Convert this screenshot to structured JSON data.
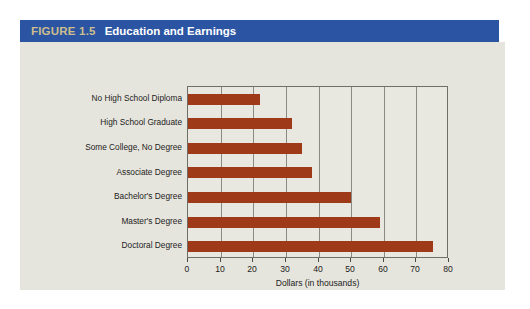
{
  "figure": {
    "number": "FIGURE 1.5",
    "title": "Education and Earnings",
    "header_color": "#2b55a2",
    "number_color": "#cdbe8e",
    "title_color": "#ffffff",
    "background_color": "#e6e5dd"
  },
  "chart_data": {
    "type": "bar",
    "orientation": "horizontal",
    "title": "Education and Earnings",
    "xlabel": "Dollars (in thousands)",
    "ylabel": "",
    "xlim": [
      0,
      80
    ],
    "xticks": [
      0,
      10,
      20,
      30,
      40,
      50,
      60,
      70,
      80
    ],
    "xtick_labels": [
      "0",
      "10",
      "20",
      "30",
      "40",
      "50",
      "60",
      "70",
      "80"
    ],
    "grid": true,
    "legend": false,
    "bar_color": "#9e3a17",
    "categories": [
      "No High School Diploma",
      "High School Graduate",
      "Some College, No Degree",
      "Associate Degree",
      "Bachelor's Degree",
      "Master's Degree",
      "Doctoral Degree"
    ],
    "values": [
      22,
      32,
      35,
      38,
      50,
      59,
      75
    ]
  }
}
